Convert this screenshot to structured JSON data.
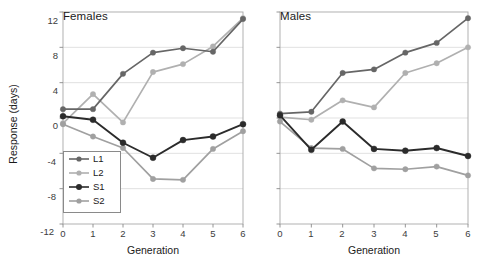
{
  "figure": {
    "ylabel": "Response (days)",
    "xlabel_left": "Generation",
    "xlabel_right": "Generation",
    "yticks": [
      "12",
      "8",
      "4",
      "0",
      "-4",
      "-8",
      "-12"
    ],
    "xticks": [
      "0",
      "1",
      "2",
      "3",
      "4",
      "5",
      "6"
    ]
  },
  "legend": {
    "items": [
      {
        "label": "L1",
        "color": "#666666"
      },
      {
        "label": "L2",
        "color": "#b0b0b0"
      },
      {
        "label": "S1",
        "color": "#2b2b2b"
      },
      {
        "label": "S2",
        "color": "#a0a0a0"
      }
    ]
  },
  "chart_data": [
    {
      "type": "line",
      "title": "Females",
      "xlabel": "Generation",
      "ylabel": "Response (days)",
      "x": [
        0,
        1,
        2,
        3,
        4,
        5,
        6
      ],
      "xlim": [
        0,
        6
      ],
      "ylim": [
        -12,
        12
      ],
      "yticks": [
        12,
        8,
        4,
        0,
        -4,
        -8,
        -12
      ],
      "grid": "horizontal",
      "legend_position": "lower-left",
      "series": [
        {
          "name": "L1",
          "color": "#666666",
          "values": [
            1.0,
            1.0,
            5.0,
            7.4,
            7.9,
            7.5,
            11.2
          ]
        },
        {
          "name": "L2",
          "color": "#b0b0b0",
          "values": [
            -0.6,
            2.7,
            -0.5,
            5.2,
            6.1,
            8.1,
            11.3
          ]
        },
        {
          "name": "S1",
          "color": "#2b2b2b",
          "values": [
            0.2,
            -0.2,
            -2.8,
            -4.5,
            -2.5,
            -2.1,
            -0.7
          ]
        },
        {
          "name": "S2",
          "color": "#a0a0a0",
          "values": [
            -0.7,
            -2.1,
            -3.4,
            -6.9,
            -7.0,
            -3.5,
            -1.5
          ]
        }
      ]
    },
    {
      "type": "line",
      "title": "Males",
      "xlabel": "Generation",
      "ylabel": "",
      "x": [
        0,
        1,
        2,
        3,
        4,
        5,
        6
      ],
      "xlim": [
        0,
        6
      ],
      "ylim": [
        -12,
        12
      ],
      "yticks": [
        12,
        8,
        4,
        0,
        -4,
        -8,
        -12
      ],
      "grid": "horizontal",
      "legend_position": "none",
      "series": [
        {
          "name": "L1",
          "color": "#666666",
          "values": [
            0.5,
            0.7,
            5.1,
            5.5,
            7.4,
            8.5,
            11.3
          ]
        },
        {
          "name": "L2",
          "color": "#b0b0b0",
          "values": [
            0.1,
            -0.2,
            2.0,
            1.2,
            5.1,
            6.2,
            8.0
          ]
        },
        {
          "name": "S1",
          "color": "#2b2b2b",
          "values": [
            0.3,
            -3.6,
            -0.4,
            -3.5,
            -3.7,
            -3.4,
            -4.3
          ]
        },
        {
          "name": "S2",
          "color": "#a0a0a0",
          "values": [
            -0.4,
            -3.4,
            -3.5,
            -5.7,
            -5.8,
            -5.5,
            -6.5
          ]
        }
      ]
    }
  ]
}
